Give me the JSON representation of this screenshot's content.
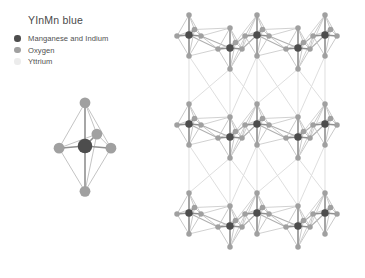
{
  "figure": {
    "title": "YInMn blue",
    "background_color": "#ffffff"
  },
  "legend": {
    "items": [
      {
        "label": "Manganese and Indium",
        "color": "#4d4d4d",
        "marker": "filled-circle"
      },
      {
        "label": "Oxygen",
        "color": "#a0a0a0",
        "marker": "filled-circle"
      },
      {
        "label": "Yttrium",
        "color": "#ececec",
        "marker": "filled-circle"
      }
    ]
  },
  "diagram": {
    "single_unit": {
      "name": "trigonal-bipyramid-unit",
      "center_atom": "Manganese and Indium",
      "vertex_atoms": "Oxygen",
      "vertex_count": 5
    },
    "lattice": {
      "name": "layered-crystal-lattice",
      "layers": 3,
      "units_per_layer": 5,
      "bond_color": "#c9c9c9"
    },
    "colors": {
      "metal": "#4d4d4d",
      "oxygen": "#a0a0a0",
      "yttrium": "#ececec",
      "bond": "#c9c9c9"
    }
  }
}
